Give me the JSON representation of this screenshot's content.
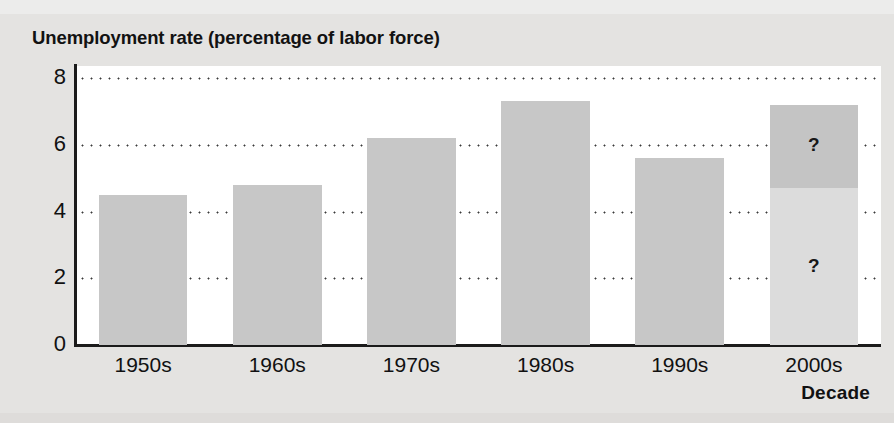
{
  "chart_data": {
    "type": "bar",
    "title": "Unemployment rate (percentage of labor force)",
    "xlabel": "Decade",
    "ylabel": "",
    "categories": [
      "1950s",
      "1960s",
      "1970s",
      "1980s",
      "1990s",
      "2000s"
    ],
    "values": [
      4.5,
      4.8,
      6.2,
      7.3,
      5.6,
      7.2
    ],
    "ylim": [
      0,
      8
    ],
    "yticks": [
      0,
      2,
      4,
      6,
      8
    ],
    "ytick_labels": [
      "0",
      "2",
      "4",
      "6",
      "8"
    ],
    "grid": "horizontal-dotted",
    "legend": "none",
    "bars": [
      {
        "category": "1950s",
        "value": 4.5,
        "label": "",
        "style": "solid"
      },
      {
        "category": "1960s",
        "value": 4.8,
        "label": "",
        "style": "solid"
      },
      {
        "category": "1970s",
        "value": 6.2,
        "label": "",
        "style": "solid"
      },
      {
        "category": "1980s",
        "value": 7.3,
        "label": "",
        "style": "solid"
      },
      {
        "category": "1990s",
        "value": 5.6,
        "label": "",
        "style": "solid"
      },
      {
        "category": "2000s",
        "value": 7.2,
        "label": "?",
        "style": "split-unknown",
        "segments": [
          {
            "from": 0,
            "to": 4.7,
            "label": "?",
            "shade": "light"
          },
          {
            "from": 4.7,
            "to": 7.2,
            "label": "?",
            "shade": "dark"
          }
        ]
      }
    ],
    "annotations": [
      {
        "text": "?",
        "at_category": "2000s",
        "at_value": 6.0
      },
      {
        "text": "?",
        "at_category": "2000s",
        "at_value": 3.4
      }
    ]
  },
  "colors": {
    "page_background": "#e4e3e1",
    "plot_background": "#ffffff",
    "bar_fill": "#c7c7c7",
    "bar_fill_light": "#dcdcdc",
    "bar_fill_dark": "#c4c4c4",
    "axis": "#1b1b1b",
    "gridline": "#3a3a3a",
    "text": "#111111"
  }
}
